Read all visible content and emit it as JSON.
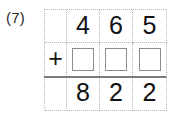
{
  "problem": {
    "label": "(7)",
    "operation_symbol": "+",
    "rows": [
      {
        "role": "addend-known",
        "cells": [
          "",
          "4",
          "6",
          "5"
        ]
      },
      {
        "role": "addend-blank",
        "cells": [
          "+",
          "",
          "",
          ""
        ]
      },
      {
        "role": "sum",
        "cells": [
          "",
          "8",
          "2",
          "2"
        ]
      }
    ],
    "colors": {
      "grid_line": "#b5b5b5",
      "answer_box_border": "#8c8c8c",
      "sum_rule": "#7d7d7d",
      "digit": "#111111",
      "background": "#ffffff"
    }
  }
}
